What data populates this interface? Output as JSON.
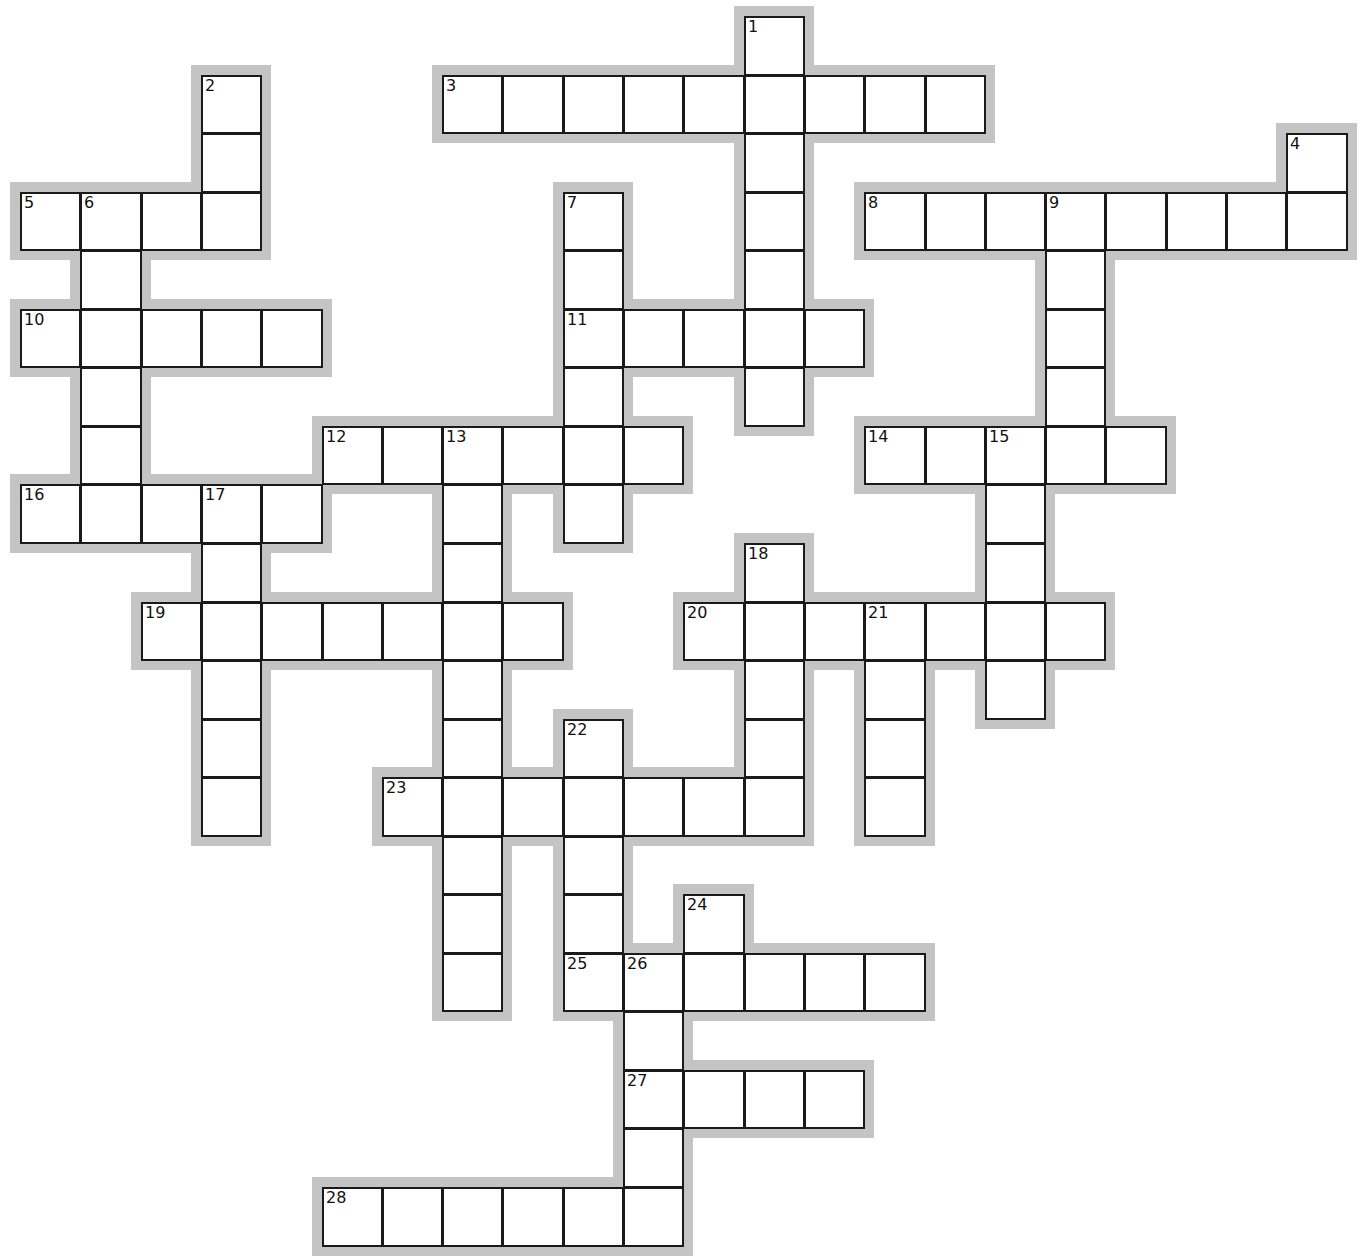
{
  "puzzle": {
    "type": "crossword",
    "clipped_header_text": "",
    "grid": {
      "origin_x": 20,
      "origin_y": 16,
      "pitch_x": 60.3,
      "pitch_y": 58.55,
      "columns": 22,
      "rows": 21,
      "cell_border_color": "#1a1a1a",
      "halo_color": "#c4c4c4",
      "cell_fill": "#ffffff"
    },
    "entries": [
      {
        "number": "1",
        "direction": "down",
        "row": 0,
        "col": 12,
        "length": 7
      },
      {
        "number": "2",
        "direction": "down",
        "row": 1,
        "col": 3,
        "length": 3
      },
      {
        "number": "3",
        "direction": "across",
        "row": 1,
        "col": 7,
        "length": 9
      },
      {
        "number": "4",
        "direction": "down",
        "row": 2,
        "col": 21,
        "length": 2
      },
      {
        "number": "5",
        "direction": "across",
        "row": 3,
        "col": 0,
        "length": 4
      },
      {
        "number": "6",
        "direction": "down",
        "row": 3,
        "col": 1,
        "length": 6
      },
      {
        "number": "7",
        "direction": "down",
        "row": 3,
        "col": 9,
        "length": 6
      },
      {
        "number": "8",
        "direction": "across",
        "row": 3,
        "col": 14,
        "length": 8
      },
      {
        "number": "9",
        "direction": "down",
        "row": 3,
        "col": 17,
        "length": 5
      },
      {
        "number": "10",
        "direction": "across",
        "row": 5,
        "col": 0,
        "length": 5
      },
      {
        "number": "11",
        "direction": "across",
        "row": 5,
        "col": 9,
        "length": 5
      },
      {
        "number": "12",
        "direction": "across",
        "row": 7,
        "col": 5,
        "length": 6
      },
      {
        "number": "13",
        "direction": "down",
        "row": 7,
        "col": 7,
        "length": 10
      },
      {
        "number": "14",
        "direction": "across",
        "row": 7,
        "col": 14,
        "length": 5
      },
      {
        "number": "15",
        "direction": "down",
        "row": 7,
        "col": 16,
        "length": 5
      },
      {
        "number": "16",
        "direction": "across",
        "row": 8,
        "col": 0,
        "length": 5
      },
      {
        "number": "17",
        "direction": "down",
        "row": 8,
        "col": 3,
        "length": 6
      },
      {
        "number": "18",
        "direction": "down",
        "row": 9,
        "col": 12,
        "length": 5
      },
      {
        "number": "19",
        "direction": "across",
        "row": 10,
        "col": 2,
        "length": 7
      },
      {
        "number": "20",
        "direction": "across",
        "row": 10,
        "col": 11,
        "length": 7
      },
      {
        "number": "21",
        "direction": "down",
        "row": 10,
        "col": 14,
        "length": 4
      },
      {
        "number": "22",
        "direction": "down",
        "row": 12,
        "col": 9,
        "length": 5
      },
      {
        "number": "23",
        "direction": "across",
        "row": 13,
        "col": 6,
        "length": 7
      },
      {
        "number": "24",
        "direction": "down",
        "row": 15,
        "col": 11,
        "length": 2
      },
      {
        "number": "25",
        "direction": "across",
        "row": 16,
        "col": 9,
        "length": 6
      },
      {
        "number": "26",
        "direction": "down",
        "row": 16,
        "col": 10,
        "length": 5
      },
      {
        "number": "27",
        "direction": "across",
        "row": 18,
        "col": 10,
        "length": 4
      },
      {
        "number": "28",
        "direction": "across",
        "row": 20,
        "col": 5,
        "length": 6
      }
    ]
  }
}
